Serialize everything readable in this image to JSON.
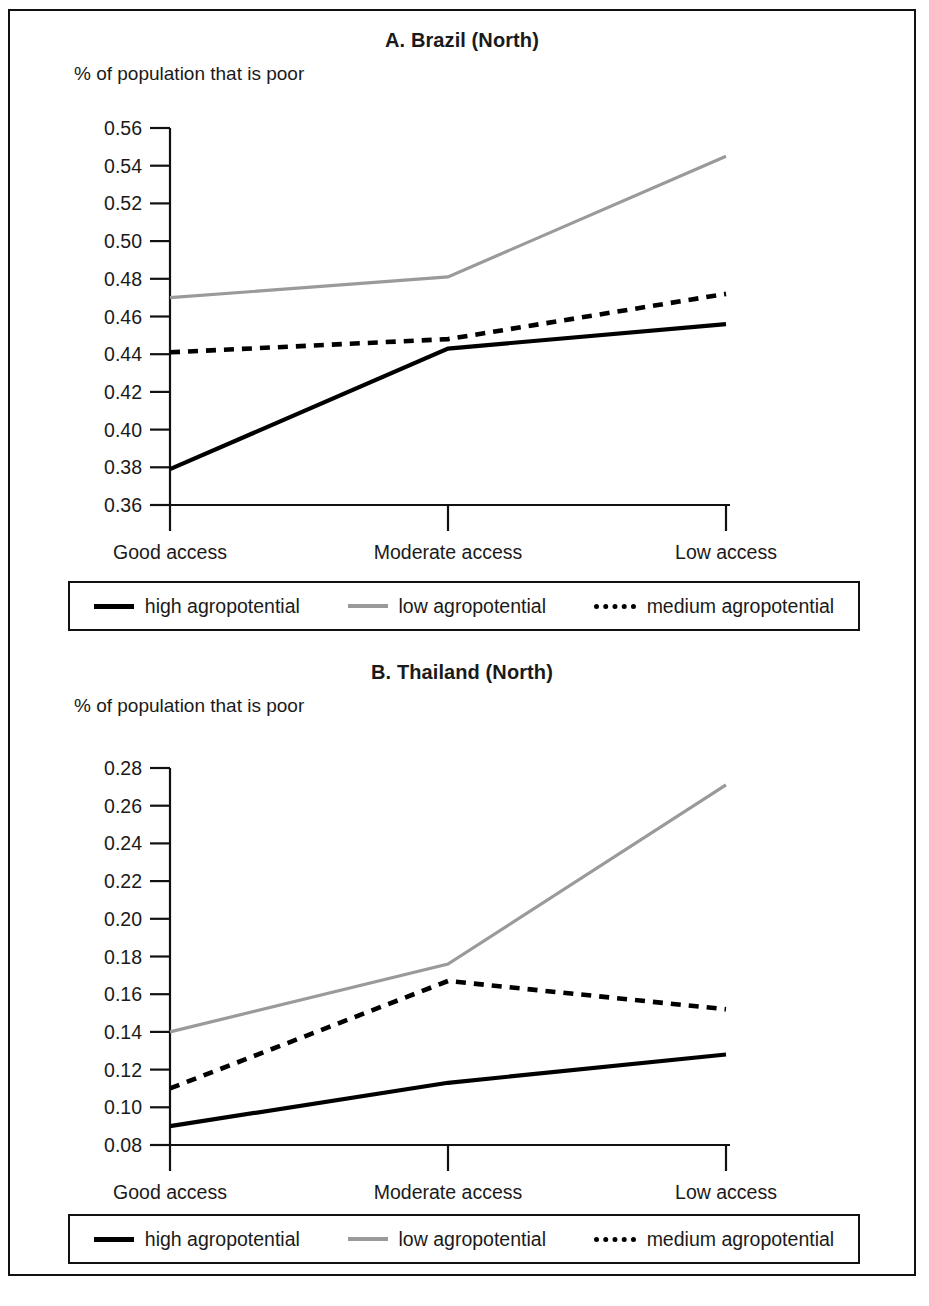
{
  "figure": {
    "panels": [
      {
        "id": "panel-a",
        "title": "A. Brazil (North)",
        "axis_caption": "% of population that is poor",
        "legend": [
          {
            "key": "high",
            "label": "high agropotential",
            "style": "solid",
            "color": "#000000"
          },
          {
            "key": "low",
            "label": "low agropotential",
            "style": "gray",
            "color": "#9a9a9a"
          },
          {
            "key": "medium",
            "label": "medium agropotential",
            "style": "dashed",
            "color": "#000000"
          }
        ]
      },
      {
        "id": "panel-b",
        "title": "B. Thailand (North)",
        "axis_caption": "% of population that is poor",
        "legend": [
          {
            "key": "high",
            "label": "high agropotential",
            "style": "solid",
            "color": "#000000"
          },
          {
            "key": "low",
            "label": "low agropotential",
            "style": "gray",
            "color": "#9a9a9a"
          },
          {
            "key": "medium",
            "label": "medium agropotential",
            "style": "dashed",
            "color": "#000000"
          }
        ]
      }
    ]
  },
  "chart_data": [
    {
      "type": "line",
      "title": "A. Brazil (North)",
      "ylabel": "% of population that is poor",
      "xlabel": "",
      "categories": [
        "Good access",
        "Moderate access",
        "Low access"
      ],
      "ylim": [
        0.36,
        0.56
      ],
      "yticks": [
        0.36,
        0.38,
        0.4,
        0.42,
        0.44,
        0.46,
        0.48,
        0.5,
        0.52,
        0.54,
        0.56
      ],
      "ytick_labels": [
        "0.36",
        "0.38",
        "0.40",
        "0.42",
        "0.44",
        "0.46",
        "0.48",
        "0.50",
        "0.52",
        "0.54",
        "0.56"
      ],
      "grid": false,
      "legend_position": "below",
      "series": [
        {
          "name": "high agropotential",
          "style": "solid",
          "color": "#000000",
          "values": [
            0.379,
            0.443,
            0.456
          ]
        },
        {
          "name": "low agropotential",
          "style": "gray",
          "color": "#9a9a9a",
          "values": [
            0.47,
            0.481,
            0.545
          ]
        },
        {
          "name": "medium agropotential",
          "style": "dashed",
          "color": "#000000",
          "values": [
            0.441,
            0.448,
            0.472
          ]
        }
      ]
    },
    {
      "type": "line",
      "title": "B. Thailand (North)",
      "ylabel": "% of population that is poor",
      "xlabel": "",
      "categories": [
        "Good access",
        "Moderate access",
        "Low access"
      ],
      "ylim": [
        0.08,
        0.28
      ],
      "yticks": [
        0.08,
        0.1,
        0.12,
        0.14,
        0.16,
        0.18,
        0.2,
        0.22,
        0.24,
        0.26,
        0.28
      ],
      "ytick_labels": [
        "0.08",
        "0.10",
        "0.12",
        "0.14",
        "0.16",
        "0.18",
        "0.20",
        "0.22",
        "0.24",
        "0.26",
        "0.28"
      ],
      "grid": false,
      "legend_position": "below",
      "series": [
        {
          "name": "high agropotential",
          "style": "solid",
          "color": "#000000",
          "values": [
            0.09,
            0.113,
            0.128
          ]
        },
        {
          "name": "low agropotential",
          "style": "gray",
          "color": "#9a9a9a",
          "values": [
            0.14,
            0.176,
            0.271
          ]
        },
        {
          "name": "medium agropotential",
          "style": "dashed",
          "color": "#000000",
          "values": [
            0.11,
            0.167,
            0.152
          ]
        }
      ]
    }
  ]
}
